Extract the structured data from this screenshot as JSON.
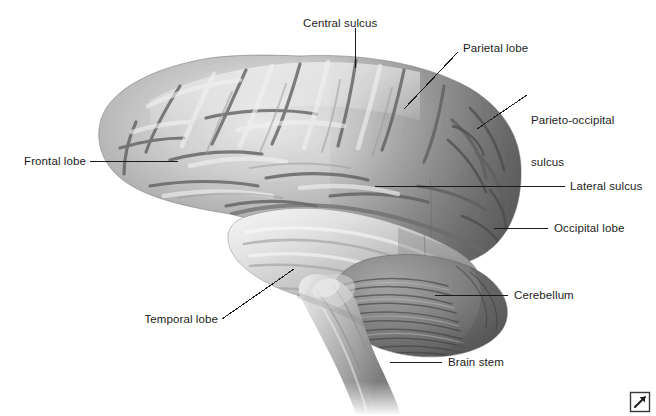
{
  "figure": {
    "background_color": "#ffffff",
    "text_color": "#1c1c1c",
    "leader_color": "#1a1a1a",
    "width": 656,
    "height": 416
  },
  "labels": {
    "central_sulcus": "Central sulcus",
    "parietal_lobe": "Parietal lobe",
    "parieto_occipital_sulcus_line1": "Parieto-occipital",
    "parieto_occipital_sulcus_line2": "sulcus",
    "lateral_sulcus": "Lateral sulcus",
    "occipital_lobe": "Occipital lobe",
    "cerebellum": "Cerebellum",
    "brain_stem": "Brain stem",
    "frontal_lobe": "Frontal lobe",
    "temporal_lobe": "Temporal lobe"
  },
  "structures": [
    {
      "name": "Central sulcus",
      "leader": "vertical",
      "side": "top"
    },
    {
      "name": "Parietal lobe",
      "leader": "diagonal",
      "side": "top-right"
    },
    {
      "name": "Parieto-occipital sulcus",
      "leader": "diagonal",
      "side": "right"
    },
    {
      "name": "Lateral sulcus",
      "leader": "horizontal",
      "side": "right"
    },
    {
      "name": "Occipital lobe",
      "leader": "horizontal",
      "side": "right"
    },
    {
      "name": "Cerebellum",
      "leader": "horizontal",
      "side": "right"
    },
    {
      "name": "Brain stem",
      "leader": "horizontal",
      "side": "right"
    },
    {
      "name": "Frontal lobe",
      "leader": "horizontal",
      "side": "left"
    },
    {
      "name": "Temporal lobe",
      "leader": "diagonal",
      "side": "bottom-left"
    }
  ],
  "icons": {
    "expand": "expand-arrow-icon"
  }
}
